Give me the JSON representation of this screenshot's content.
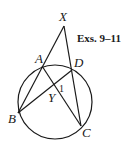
{
  "caption": "Exs. 9–11",
  "colors": {
    "ink": "#1a1a1a",
    "background": "#ffffff"
  },
  "circle": {
    "cx": 55,
    "cy": 102,
    "r": 37
  },
  "points": {
    "X": {
      "label": "X",
      "x": 64,
      "y": 26
    },
    "A": {
      "label": "A",
      "x": 42,
      "y": 66
    },
    "D": {
      "label": "D",
      "x": 72,
      "y": 70
    },
    "B": {
      "label": "B",
      "x": 18,
      "y": 113
    },
    "C": {
      "label": "C",
      "x": 81,
      "y": 126
    },
    "Y": {
      "label": "Y",
      "x": 56,
      "y": 88
    }
  },
  "segments": [
    [
      "X",
      "B"
    ],
    [
      "X",
      "C"
    ],
    [
      "A",
      "C"
    ],
    [
      "B",
      "D"
    ]
  ],
  "angle_label": "1"
}
